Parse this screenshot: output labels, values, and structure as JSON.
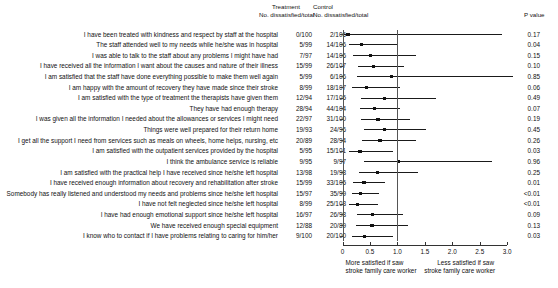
{
  "header": {
    "treatment": "Treatment",
    "control": "Control",
    "treatment_sub": "No. dissatisfied/total",
    "control_sub": "No. dissatisfied/total",
    "pvalue": "P value"
  },
  "axis": {
    "ticks": [
      "0",
      "0.5",
      "1.0",
      "1.5",
      "2.0",
      "2.5",
      "3.0"
    ],
    "tick_values": [
      0,
      0.5,
      1.0,
      1.5,
      2.0,
      2.5,
      3.0
    ],
    "xlim": [
      0,
      3.0
    ],
    "null_value": 1.0,
    "left_caption_line1": "More satisfied if saw",
    "left_caption_line2": "stroke family care worker",
    "right_caption_line1": "Less satisfied if saw",
    "right_caption_line2": "stroke family care worker"
  },
  "colors": {
    "marker": "#111111",
    "line": "#1a1a1a",
    "axis": "#333333",
    "null_line": "#555555",
    "background": "#ffffff"
  },
  "chart_data": {
    "type": "forest",
    "title": "",
    "xlabel": "Odds ratio",
    "ylabel": "",
    "xlim": [
      0,
      3.0
    ],
    "grid": false,
    "legend": "none",
    "null_value": 1.0,
    "columns": [
      "Statement",
      "Treatment No. dissatisfied/total",
      "Control No. dissatisfied/total",
      "P value"
    ],
    "rows": [
      {
        "label": "I have been treated with kindness and respect by staff at the hospital",
        "treatment": "0/100",
        "control": "2/106",
        "p": "0.17",
        "est": 0.1,
        "lo": 0.0,
        "hi": 2.9
      },
      {
        "label": "The staff attended well to my needs while he/she was in hospital",
        "treatment": "5/99",
        "control": "14/106",
        "p": "0.04",
        "est": 0.35,
        "lo": 0.12,
        "hi": 1.01
      },
      {
        "label": "I was able to talk to the staff about any problems I might have had",
        "treatment": "7/97",
        "control": "14/106",
        "p": "0.15",
        "est": 0.51,
        "lo": 0.2,
        "hi": 1.33
      },
      {
        "label": "I have received all the information I want about the causes and nature of their illness",
        "treatment": "15/99",
        "control": "26/107",
        "p": "0.10",
        "est": 0.56,
        "lo": 0.28,
        "hi": 1.12
      },
      {
        "label": "I am satisfied that the staff have done everything possible to make them well again",
        "treatment": "5/99",
        "control": "6/106",
        "p": "0.85",
        "est": 0.89,
        "lo": 0.26,
        "hi": 3.1
      },
      {
        "label": "I am happy with the amount of recovery they have made since their stroke",
        "treatment": "8/99",
        "control": "18/107",
        "p": "0.06",
        "est": 0.44,
        "lo": 0.18,
        "hi": 1.04
      },
      {
        "label": "I am satisfied with the type of treatment the therapists have given them",
        "treatment": "12/94",
        "control": "17/105",
        "p": "0.49",
        "est": 0.76,
        "lo": 0.34,
        "hi": 1.7
      },
      {
        "label": "They have had enough therapy",
        "treatment": "28/94",
        "control": "44/104",
        "p": "0.07",
        "est": 0.58,
        "lo": 0.32,
        "hi": 1.04
      },
      {
        "label": "I was given all the information I needed about the allowances or services I might need",
        "treatment": "22/97",
        "control": "31/100",
        "p": "0.19",
        "est": 0.65,
        "lo": 0.34,
        "hi": 1.23
      },
      {
        "label": "Things were well prepared for their return home",
        "treatment": "19/93",
        "control": "24/96",
        "p": "0.45",
        "est": 0.77,
        "lo": 0.39,
        "hi": 1.53
      },
      {
        "label": "I get all the support I need from services such as meals on wheels, home helps, nursing, etc",
        "treatment": "20/89",
        "control": "28/94",
        "p": "0.26",
        "est": 0.68,
        "lo": 0.35,
        "hi": 1.33
      },
      {
        "label": "I am satisfied with the outpatient services provided by the hospital",
        "treatment": "5/95",
        "control": "15/101",
        "p": "0.03",
        "est": 0.32,
        "lo": 0.11,
        "hi": 0.92
      },
      {
        "label": "I think the ambulance service is reliable",
        "treatment": "9/95",
        "control": "9/97",
        "p": "0.96",
        "est": 1.02,
        "lo": 0.39,
        "hi": 2.73
      },
      {
        "label": "I am satisfied with the practical help I have received since he/she left hospital",
        "treatment": "13/98",
        "control": "19/98",
        "p": "0.25",
        "est": 0.64,
        "lo": 0.3,
        "hi": 1.37
      },
      {
        "label": "I have received enough information about recovery and rehabilitation after stroke",
        "treatment": "15/99",
        "control": "33/105",
        "p": "0.01",
        "est": 0.39,
        "lo": 0.2,
        "hi": 0.78
      },
      {
        "label": "Somebody has really listened and understood my needs and problems since he/she left hospital",
        "treatment": "15/97",
        "control": "35/99",
        "p": "<0.01",
        "est": 0.33,
        "lo": 0.17,
        "hi": 0.66
      },
      {
        "label": "I have not felt neglected since he/she left hospital",
        "treatment": "8/99",
        "control": "25/103",
        "p": "<0.01",
        "est": 0.27,
        "lo": 0.12,
        "hi": 0.64
      },
      {
        "label": "I have had enough emotional support since he/she left hospital",
        "treatment": "16/97",
        "control": "26/98",
        "p": "0.09",
        "est": 0.55,
        "lo": 0.27,
        "hi": 1.1
      },
      {
        "label": "We have received enough special equipment",
        "treatment": "12/88",
        "control": "20/89",
        "p": "0.13",
        "est": 0.54,
        "lo": 0.25,
        "hi": 1.19
      },
      {
        "label": "I know who to contact if I have problems relating to caring for him/her",
        "treatment": "9/100",
        "control": "20/100",
        "p": "0.03",
        "est": 0.4,
        "lo": 0.17,
        "hi": 0.92
      }
    ]
  }
}
